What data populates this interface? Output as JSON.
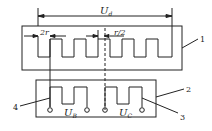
{
  "diagram": {
    "dimension_top": {
      "symbol": "U",
      "subscript": "d"
    },
    "dimension_left": {
      "text": "2r"
    },
    "dimension_right": {
      "text": "r/2"
    },
    "voltage_left": {
      "symbol": "U",
      "subscript": "B"
    },
    "voltage_right": {
      "symbol": "U",
      "subscript": "C"
    },
    "callouts": [
      "1",
      "2",
      "3",
      "4"
    ],
    "colors": {
      "line": "#222222",
      "background": "#ffffff"
    }
  }
}
